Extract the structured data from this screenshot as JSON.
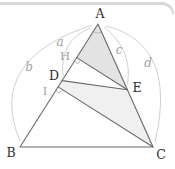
{
  "figure": {
    "type": "geometry-diagram",
    "shapes": [
      "triangle ABC",
      "shaded triangle AHE",
      "shaded quadrilateral DECI"
    ],
    "segments": [
      "AB",
      "BC",
      "CA",
      "DE",
      "HE",
      "IC"
    ],
    "right_angle_marks_at": [
      "H",
      "I"
    ],
    "angle_arc_at": "A"
  },
  "points": {
    "A": {
      "label": "A"
    },
    "B": {
      "label": "B"
    },
    "C": {
      "label": "C"
    },
    "D": {
      "label": "D"
    },
    "E": {
      "label": "E"
    },
    "H": {
      "label": "H"
    },
    "I": {
      "label": "I"
    }
  },
  "length_labels": {
    "a": "a",
    "b": "b",
    "c": "c",
    "d": "d"
  },
  "colors": {
    "background": "#ffffff",
    "line": "#6a6a6a",
    "faint_arc": "#c9c9c9",
    "mark": "#b4b4b4",
    "label_dark": "#2e2e2e",
    "label_gray": "#a2a2a2",
    "fill_triangle_ahe": "#e3e3e3",
    "fill_quad_deci": "#f0f0f0",
    "top_border": "#d7d7d7"
  }
}
